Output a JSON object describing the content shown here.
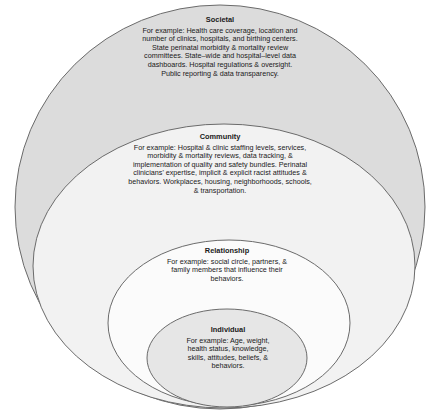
{
  "diagram": {
    "type": "nested-ellipses (socio-ecological model)",
    "levels": [
      {
        "id": "societal",
        "title": "Societal",
        "body": "For example:  Health care coverage, location and number of clinics, hospitals, and birthing centers. State perinatal morbidity & mortality review committees. State–wide and hospital–level data dashboards. Hospital regulations & oversight. Public reporting & data transparency.",
        "fill": "#dcdcdc"
      },
      {
        "id": "community",
        "title": "Community",
        "body": "For example:  Hospital & clinic staffing levels, services, morbidity & mortality reviews, data tracking, & implementation of quality and safety bundles. Perinatal clinicians' expertise, implicit & explicit racist attitudes & behaviors. Workplaces, housing, neighborhoods,  schools, & transportation.",
        "fill": "#f2f2f2"
      },
      {
        "id": "relationship",
        "title": "Relationship",
        "body": "For example:  social circle, partners,  & family members that influence their behaviors.",
        "fill": "#fbfbfb"
      },
      {
        "id": "individual",
        "title": "Individual",
        "body": "For example: Age, weight, health status, knowledge, skills, attitudes, beliefs, & behaviors.",
        "fill": "#e6e6e6"
      }
    ],
    "stroke": "#6b6b6b"
  }
}
